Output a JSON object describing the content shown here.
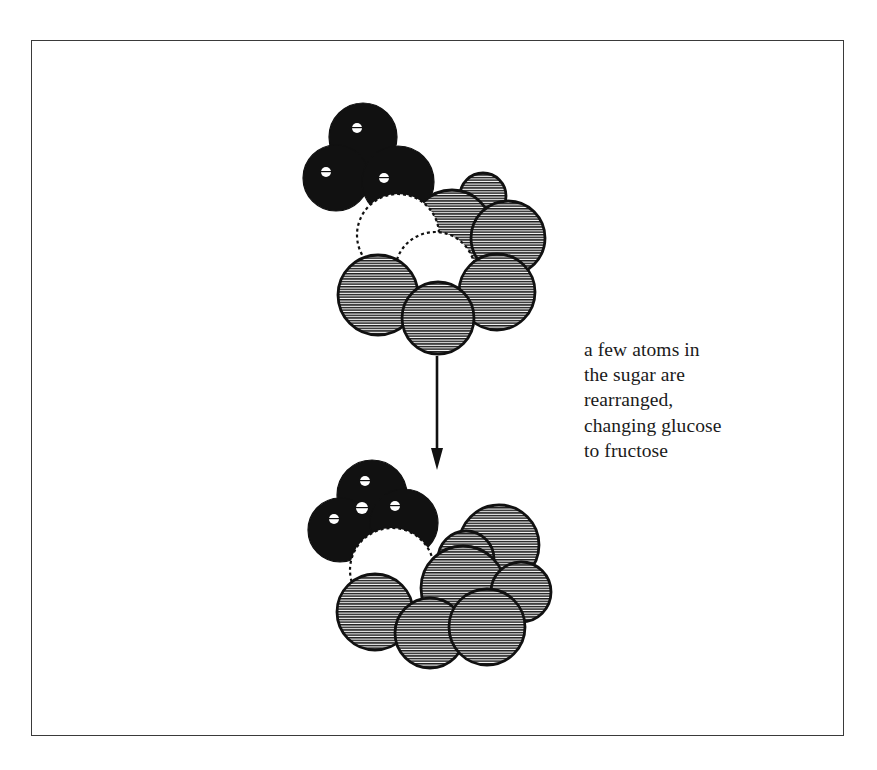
{
  "figure": {
    "name": "glucose-to-fructose-conversion",
    "background_color": "#ffffff",
    "frame": {
      "color": "#3a3a3a",
      "x": 31,
      "y": 40,
      "width": 813,
      "height": 696
    },
    "caption": {
      "text": "a few atoms in\nthe sugar are\nrearranged,\nchanging glucose\nto fructose",
      "lines": [
        "a few atoms in",
        "the sugar are",
        "rearranged,",
        "changing glucose",
        "to fructose"
      ],
      "color": "#1a1a1a",
      "font_size_px": 19.5
    },
    "arrow": {
      "name": "downward-conversion-arrow",
      "x": 437,
      "y_start": 356,
      "y_end": 470,
      "color": "#111111"
    },
    "atom_colors": {
      "black": "#111111",
      "white": "#ffffff",
      "hatched_gray": "#b9b9b9",
      "outline": "#111111",
      "highlight": "#ffffff"
    },
    "molecules": [
      {
        "name": "glucose-molecule",
        "label": "glucose",
        "position": "top",
        "atoms": [
          {
            "type": "black",
            "cx": 363,
            "cy": 137,
            "r": 34
          },
          {
            "type": "black",
            "cx": 336,
            "cy": 178,
            "r": 33
          },
          {
            "type": "black",
            "cx": 398,
            "cy": 182,
            "r": 36
          },
          {
            "type": "hatched",
            "cx": 483,
            "cy": 196,
            "r": 23
          },
          {
            "type": "hatched",
            "cx": 452,
            "cy": 230,
            "r": 40
          },
          {
            "type": "hatched",
            "cx": 508,
            "cy": 238,
            "r": 37
          },
          {
            "type": "white",
            "cx": 398,
            "cy": 235,
            "r": 41
          },
          {
            "type": "white",
            "cx": 435,
            "cy": 272,
            "r": 40
          },
          {
            "type": "hatched",
            "cx": 378,
            "cy": 295,
            "r": 40
          },
          {
            "type": "hatched",
            "cx": 497,
            "cy": 292,
            "r": 38
          },
          {
            "type": "hatched",
            "cx": 438,
            "cy": 318,
            "r": 36
          }
        ],
        "highlights": [
          {
            "cx": 357,
            "cy": 128,
            "r": 5
          },
          {
            "cx": 326,
            "cy": 172,
            "r": 5
          },
          {
            "cx": 384,
            "cy": 178,
            "r": 5
          }
        ]
      },
      {
        "name": "fructose-molecule",
        "label": "fructose",
        "position": "bottom",
        "atoms": [
          {
            "type": "black",
            "cx": 372,
            "cy": 495,
            "r": 35
          },
          {
            "type": "black",
            "cx": 340,
            "cy": 530,
            "r": 32
          },
          {
            "type": "black",
            "cx": 404,
            "cy": 523,
            "r": 34
          },
          {
            "type": "hatched",
            "cx": 499,
            "cy": 545,
            "r": 40
          },
          {
            "type": "hatched",
            "cx": 466,
            "cy": 559,
            "r": 28
          },
          {
            "type": "white",
            "cx": 392,
            "cy": 570,
            "r": 42
          },
          {
            "type": "hatched",
            "cx": 463,
            "cy": 588,
            "r": 42
          },
          {
            "type": "hatched",
            "cx": 521,
            "cy": 592,
            "r": 30
          },
          {
            "type": "hatched",
            "cx": 375,
            "cy": 612,
            "r": 38
          },
          {
            "type": "hatched",
            "cx": 430,
            "cy": 633,
            "r": 35
          },
          {
            "type": "hatched",
            "cx": 487,
            "cy": 627,
            "r": 38
          }
        ],
        "highlights": [
          {
            "cx": 365,
            "cy": 481,
            "r": 5
          },
          {
            "cx": 334,
            "cy": 519,
            "r": 5
          },
          {
            "cx": 362,
            "cy": 508,
            "r": 6
          },
          {
            "cx": 395,
            "cy": 506,
            "r": 5
          }
        ]
      }
    ]
  }
}
